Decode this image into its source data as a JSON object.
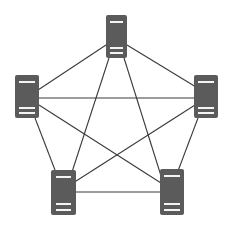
{
  "diagram": {
    "type": "full-mesh-network",
    "colors": {
      "server": "#5b5b5b",
      "stripe": "#f4f4f4",
      "link": "#3a3a3a",
      "background": "#ffffff"
    },
    "nodes": [
      {
        "id": "top",
        "icon": "server-icon",
        "x": 106,
        "y": 15,
        "w": 21,
        "h": 43
      },
      {
        "id": "left",
        "icon": "server-icon",
        "x": 15,
        "y": 75,
        "w": 24,
        "h": 43
      },
      {
        "id": "right",
        "icon": "server-icon",
        "x": 194,
        "y": 75,
        "w": 24,
        "h": 43
      },
      {
        "id": "bottom-left",
        "icon": "server-icon",
        "x": 51,
        "y": 170,
        "w": 25,
        "h": 45
      },
      {
        "id": "bottom-right",
        "icon": "server-icon",
        "x": 160,
        "y": 169,
        "w": 24,
        "h": 46
      }
    ],
    "edges": [
      {
        "from": "top",
        "to": "left",
        "x1": 106,
        "y1": 45,
        "x2": 38,
        "y2": 90
      },
      {
        "from": "top",
        "to": "right",
        "x1": 127,
        "y1": 45,
        "x2": 196,
        "y2": 87
      },
      {
        "from": "top",
        "to": "bottom-left",
        "x1": 109,
        "y1": 58,
        "x2": 72,
        "y2": 172
      },
      {
        "from": "top",
        "to": "bottom-right",
        "x1": 124,
        "y1": 58,
        "x2": 162,
        "y2": 179
      },
      {
        "from": "left",
        "to": "right",
        "x1": 39,
        "y1": 98,
        "x2": 194,
        "y2": 98
      },
      {
        "from": "left",
        "to": "bottom-right",
        "x1": 39,
        "y1": 105,
        "x2": 161,
        "y2": 183
      },
      {
        "from": "right",
        "to": "bottom-left",
        "x1": 195,
        "y1": 105,
        "x2": 73,
        "y2": 183
      },
      {
        "from": "left",
        "to": "bottom-left",
        "x1": 35,
        "y1": 118,
        "x2": 55,
        "y2": 170
      },
      {
        "from": "right",
        "to": "bottom-right",
        "x1": 198,
        "y1": 118,
        "x2": 178,
        "y2": 171
      },
      {
        "from": "bottom-left",
        "to": "bottom-right",
        "x1": 76,
        "y1": 192,
        "x2": 160,
        "y2": 192
      }
    ]
  }
}
